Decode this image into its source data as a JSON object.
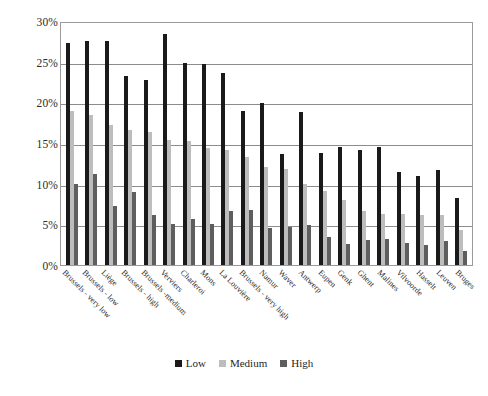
{
  "chart_data": {
    "type": "bar",
    "title": "",
    "xlabel": "",
    "ylabel": "",
    "ylim": [
      0,
      30
    ],
    "y_tick_labels": [
      "30%",
      "25%",
      "20%",
      "15%",
      "10%",
      "5%",
      "0%"
    ],
    "y_ticks": [
      30,
      25,
      20,
      15,
      10,
      5,
      0
    ],
    "grid": true,
    "legend_position": "bottom",
    "legend": [
      "Low",
      "Medium",
      "High"
    ],
    "categories": [
      "Brussels - very low",
      "Brussels - low",
      "Liège",
      "Brussels - high",
      "Brussels -medium",
      "Verviers",
      "Charleroi",
      "Mons",
      "La Louvière",
      "Brussels - very high",
      "Namur",
      "Waver",
      "Antwerp",
      "Eupen",
      "Genk",
      "Ghent",
      "Malines",
      "Vilvoorde",
      "Hasselt",
      "Leuven",
      "Bruges"
    ],
    "series": [
      {
        "name": "Low",
        "color": "#1a1a1a",
        "values": [
          27.3,
          27.5,
          27.5,
          23.3,
          22.8,
          28.4,
          24.8,
          24.7,
          23.6,
          18.9,
          19.9,
          13.6,
          18.8,
          13.8,
          14.5,
          14.2,
          14.5,
          11.4,
          11.0,
          11.7,
          8.2
        ]
      },
      {
        "name": "Medium",
        "color": "#bdbdbd",
        "values": [
          18.9,
          18.5,
          17.2,
          16.6,
          16.4,
          15.4,
          15.3,
          14.4,
          14.2,
          13.3,
          12.1,
          11.8,
          10.0,
          9.1,
          8.0,
          6.7,
          6.3,
          6.3,
          6.2,
          6.1,
          4.3
        ]
      },
      {
        "name": "High",
        "color": "#5e5e5e",
        "values": [
          9.9,
          11.2,
          7.3,
          9.0,
          6.2,
          5.1,
          5.7,
          5.0,
          6.6,
          6.8,
          4.6,
          4.7,
          4.9,
          3.5,
          2.6,
          3.1,
          3.2,
          2.7,
          2.4,
          2.9,
          1.7
        ]
      }
    ]
  },
  "legend_items": [
    {
      "label": "Low",
      "color": "#1a1a1a"
    },
    {
      "label": "Medium",
      "color": "#bdbdbd"
    },
    {
      "label": "High",
      "color": "#5e5e5e"
    }
  ]
}
